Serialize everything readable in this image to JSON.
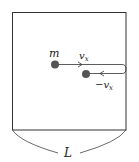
{
  "diagram": {
    "type": "physics-box-collision",
    "box": {
      "label": "L"
    },
    "particle": {
      "label": "m",
      "color": "#555555"
    },
    "velocity_in": {
      "label": "v",
      "subscript": "x"
    },
    "velocity_out": {
      "label": "−v",
      "subscript": "x"
    },
    "line_color": "#333333"
  }
}
